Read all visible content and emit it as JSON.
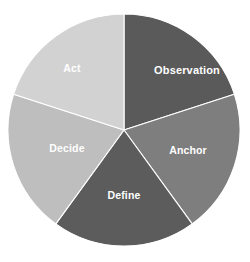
{
  "chart_data": {
    "type": "pie",
    "title": "",
    "subtitle": "",
    "xlabel": "",
    "ylabel": "",
    "legend_position": "none",
    "labels_inside_slices": true,
    "background_color": "#ffffff",
    "label_text_color": "#ffffff",
    "center": {
      "x": 124,
      "y": 130
    },
    "radius": 116,
    "start_angle_deg": 0,
    "direction": "clockwise",
    "categories": [
      "Observation",
      "Anchor",
      "Define",
      "Decide",
      "Act"
    ],
    "values": [
      20,
      20,
      20,
      20,
      20
    ],
    "percentages": [
      "20%",
      "20%",
      "20%",
      "20%",
      "20%"
    ],
    "colors": [
      "#5a5a5a",
      "#7e7e7e",
      "#5c5c5c",
      "#bebebe",
      "#d2d2d2"
    ],
    "slices": [
      {
        "label": "Observation",
        "value": 20,
        "percent": "20%",
        "color": "#5a5a5a",
        "start_angle_deg": 0,
        "end_angle_deg": 72,
        "label_x": 187,
        "label_y": 71
      },
      {
        "label": "Anchor",
        "value": 20,
        "percent": "20%",
        "color": "#7e7e7e",
        "start_angle_deg": 72,
        "end_angle_deg": 144,
        "label_x": 188,
        "label_y": 151
      },
      {
        "label": "Define",
        "value": 20,
        "percent": "20%",
        "color": "#5c5c5c",
        "start_angle_deg": 144,
        "end_angle_deg": 216,
        "label_x": 124,
        "label_y": 196
      },
      {
        "label": "Decide",
        "value": 20,
        "percent": "20%",
        "color": "#bebebe",
        "start_angle_deg": 216,
        "end_angle_deg": 288,
        "label_x": 67,
        "label_y": 149
      },
      {
        "label": "Act",
        "value": 20,
        "percent": "20%",
        "color": "#d2d2d2",
        "start_angle_deg": 288,
        "end_angle_deg": 360,
        "label_x": 72,
        "label_y": 69
      }
    ]
  }
}
